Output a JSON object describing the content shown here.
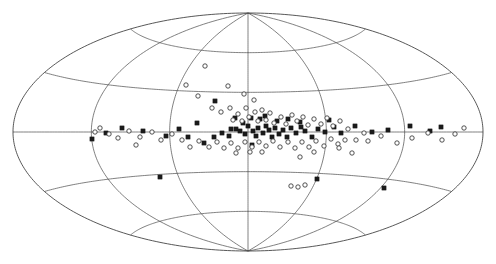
{
  "figure": {
    "kind": "all-sky-scatter-map",
    "projection": "Aitoff",
    "background_color": "#ffffff",
    "line_color": "#4a4a4a",
    "filled_marker_color": "#1a1a1a",
    "open_marker_color": "#ffffff",
    "open_marker_edge_color": "#333333"
  },
  "chart_data": {
    "type": "scatter",
    "title": "",
    "subtitle": "",
    "xlabel": "",
    "ylabel": "",
    "projection": "aitoff",
    "coordinate_system": "galactic",
    "grid": true,
    "legend_position": "none",
    "xlim": [
      180,
      -180
    ],
    "ylim": [
      -90,
      90
    ],
    "tick_labels_visible": false,
    "graticule": {
      "meridian_step_deg": 60,
      "parallel_step_deg": 30,
      "meridians_deg": [
        -180,
        -120,
        -60,
        0,
        60,
        120,
        180
      ],
      "parallels_deg": [
        -60,
        -30,
        0,
        30,
        60
      ]
    },
    "outline": {
      "center_px": [
        248,
        132
      ],
      "semi_major_px": 235,
      "semi_minor_px": 119
    },
    "series": [
      {
        "name": "filled-square-sources",
        "marker": "filled-square",
        "marker_size_px": 4.2,
        "count": 57,
        "points_px": [
          [
            215,
            101
          ],
          [
            248,
            126
          ],
          [
            260,
            119
          ],
          [
            236,
            129
          ],
          [
            197,
            123
          ],
          [
            204,
            143
          ],
          [
            214,
            137
          ],
          [
            222,
            133
          ],
          [
            229,
            136
          ],
          [
            231,
            129
          ],
          [
            240,
            131
          ],
          [
            245,
            134
          ],
          [
            243,
            123
          ],
          [
            253,
            131
          ],
          [
            256,
            136
          ],
          [
            258,
            128
          ],
          [
            263,
            133
          ],
          [
            266,
            126
          ],
          [
            269,
            130
          ],
          [
            272,
            137
          ],
          [
            275,
            128
          ],
          [
            279,
            134
          ],
          [
            283,
            130
          ],
          [
            287,
            137
          ],
          [
            291,
            128
          ],
          [
            296,
            133
          ],
          [
            301,
            127
          ],
          [
            305,
            131
          ],
          [
            312,
            137
          ],
          [
            318,
            129
          ],
          [
            325,
            132
          ],
          [
            334,
            127
          ],
          [
            341,
            133
          ],
          [
            355,
            126
          ],
          [
            372,
            132
          ],
          [
            388,
            130
          ],
          [
            410,
            126
          ],
          [
            430,
            131
          ],
          [
            441,
            127
          ],
          [
            188,
            137
          ],
          [
            179,
            129
          ],
          [
            166,
            136
          ],
          [
            160,
            177
          ],
          [
            143,
            131
          ],
          [
            122,
            128
          ],
          [
            106,
            133
          ],
          [
            92,
            139
          ],
          [
            329,
            120
          ],
          [
            235,
            118
          ],
          [
            251,
            118
          ],
          [
            265,
            116
          ],
          [
            277,
            121
          ],
          [
            288,
            119
          ],
          [
            300,
            122
          ],
          [
            317,
            179
          ],
          [
            384,
            188
          ],
          [
            252,
            145
          ]
        ]
      },
      {
        "name": "open-circle-sources",
        "marker": "open-circle",
        "marker_size_px": 4.4,
        "count": 85,
        "points_px": [
          [
            205,
            66
          ],
          [
            186,
            85
          ],
          [
            198,
            96
          ],
          [
            228,
            86
          ],
          [
            212,
            108
          ],
          [
            221,
            112
          ],
          [
            230,
            108
          ],
          [
            238,
            114
          ],
          [
            246,
            108
          ],
          [
            233,
            120
          ],
          [
            242,
            121
          ],
          [
            249,
            117
          ],
          [
            255,
            112
          ],
          [
            262,
            110
          ],
          [
            258,
            121
          ],
          [
            266,
            120
          ],
          [
            270,
            113
          ],
          [
            274,
            123
          ],
          [
            281,
            117
          ],
          [
            286,
            124
          ],
          [
            292,
            115
          ],
          [
            297,
            121
          ],
          [
            303,
            117
          ],
          [
            308,
            125
          ],
          [
            314,
            119
          ],
          [
            321,
            124
          ],
          [
            327,
            118
          ],
          [
            333,
            126
          ],
          [
            340,
            121
          ],
          [
            348,
            129
          ],
          [
            356,
            140
          ],
          [
            364,
            133
          ],
          [
            345,
            140
          ],
          [
            338,
            144
          ],
          [
            331,
            139
          ],
          [
            324,
            146
          ],
          [
            316,
            141
          ],
          [
            309,
            147
          ],
          [
            302,
            142
          ],
          [
            295,
            148
          ],
          [
            288,
            142
          ],
          [
            280,
            147
          ],
          [
            273,
            141
          ],
          [
            266,
            146
          ],
          [
            259,
            142
          ],
          [
            252,
            147
          ],
          [
            245,
            142
          ],
          [
            238,
            148
          ],
          [
            231,
            143
          ],
          [
            224,
            148
          ],
          [
            217,
            142
          ],
          [
            209,
            147
          ],
          [
            199,
            141
          ],
          [
            190,
            147
          ],
          [
            182,
            140
          ],
          [
            172,
            134
          ],
          [
            161,
            140
          ],
          [
            152,
            132
          ],
          [
            140,
            137
          ],
          [
            129,
            131
          ],
          [
            118,
            138
          ],
          [
            100,
            128
          ],
          [
            95,
            132
          ],
          [
            109,
            134
          ],
          [
            136,
            145
          ],
          [
            250,
            152
          ],
          [
            262,
            152
          ],
          [
            236,
            153
          ],
          [
            300,
            157
          ],
          [
            314,
            152
          ],
          [
            339,
            148
          ],
          [
            352,
            153
          ],
          [
            368,
            141
          ],
          [
            381,
            136
          ],
          [
            397,
            143
          ],
          [
            412,
            138
          ],
          [
            428,
            133
          ],
          [
            442,
            140
          ],
          [
            455,
            134
          ],
          [
            464,
            128
          ],
          [
            291,
            186
          ],
          [
            298,
            187
          ],
          [
            305,
            185
          ],
          [
            244,
            94
          ],
          [
            254,
            100
          ]
        ]
      }
    ]
  }
}
